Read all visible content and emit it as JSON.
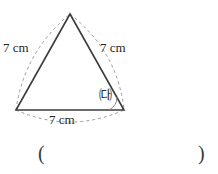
{
  "figure": {
    "type": "equilateral-triangle-diagram",
    "shape_name": "triangle",
    "background_color": "#ffffff",
    "stroke_color": "#3c3c3c",
    "dashed_arc_color": "#9a9a9a",
    "text_color": "#262626",
    "side_labels": {
      "left": "7 cm",
      "right": "7 cm",
      "bottom": "7 cm"
    },
    "angle_marker": {
      "label": "㈐",
      "vertex": "bottom-right"
    },
    "vertices": {
      "apex": {
        "x": 70,
        "y": 14
      },
      "bottom_left": {
        "x": 16,
        "y": 110
      },
      "bottom_right": {
        "x": 124,
        "y": 110
      }
    },
    "answer_blank": {
      "open": "(",
      "close": ")",
      "value": ""
    }
  }
}
